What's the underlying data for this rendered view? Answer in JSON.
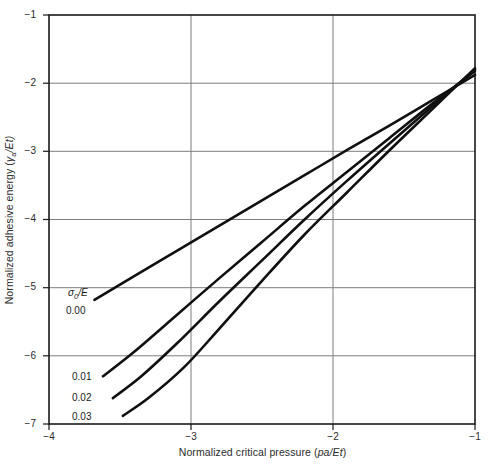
{
  "chart_data": {
    "type": "line",
    "title": "",
    "xlabel": "Normalized critical pressure (pa/Et)",
    "ylabel": "Normalized adhesive energy (γa/Et)",
    "xlim": [
      -4,
      -1
    ],
    "ylim": [
      -7,
      -1
    ],
    "xticks": [
      -4,
      -3,
      -2,
      -1
    ],
    "yticks": [
      -1,
      -2,
      -3,
      -4,
      -5,
      -6,
      -7
    ],
    "xtick_labels": [
      "−4",
      "−3",
      "−2",
      "−1"
    ],
    "ytick_labels": [
      "−1",
      "−2",
      "−3",
      "−4",
      "−5",
      "−6",
      "−7"
    ],
    "grid": true,
    "grid_color": "#808080",
    "legend_position": "inside-left",
    "series_parameter_label": "σ0/E",
    "line_color": "#101010",
    "series": [
      {
        "name": "0.00",
        "label": "0.00",
        "x": [
          -3.68,
          -3.4,
          -3.1,
          -2.8,
          -2.5,
          -2.2,
          -1.9,
          -1.6,
          -1.3,
          -1.0
        ],
        "y": [
          -5.18,
          -4.83,
          -4.46,
          -4.09,
          -3.72,
          -3.35,
          -2.98,
          -2.62,
          -2.25,
          -1.88
        ]
      },
      {
        "name": "0.01",
        "label": "0.01",
        "x": [
          -3.62,
          -3.4,
          -3.1,
          -2.8,
          -2.5,
          -2.2,
          -1.9,
          -1.6,
          -1.3,
          -1.0
        ],
        "y": [
          -6.3,
          -5.94,
          -5.4,
          -4.86,
          -4.33,
          -3.8,
          -3.3,
          -2.8,
          -2.3,
          -1.82
        ]
      },
      {
        "name": "0.02",
        "label": "0.02",
        "x": [
          -3.55,
          -3.35,
          -3.1,
          -2.8,
          -2.5,
          -2.2,
          -1.9,
          -1.6,
          -1.3,
          -1.0
        ],
        "y": [
          -6.62,
          -6.3,
          -5.82,
          -5.2,
          -4.6,
          -4.0,
          -3.43,
          -2.88,
          -2.34,
          -1.8
        ]
      },
      {
        "name": "0.03",
        "label": "0.03",
        "x": [
          -3.48,
          -3.3,
          -3.05,
          -2.8,
          -2.5,
          -2.2,
          -1.9,
          -1.6,
          -1.3,
          -1.0
        ],
        "y": [
          -6.88,
          -6.62,
          -6.17,
          -5.6,
          -4.9,
          -4.22,
          -3.6,
          -2.98,
          -2.38,
          -1.78
        ]
      }
    ]
  },
  "axes": {
    "y_title_prefix": "Normalized adhesive energy (",
    "y_title_symbol": "γ",
    "y_title_sub": "a",
    "y_title_suffix": "/Et)",
    "x_title_prefix": "Normalized critical pressure (",
    "x_title_symbol": "pa/Et",
    "x_title_suffix": ")"
  },
  "legend": {
    "parameter_symbol": "σ",
    "parameter_sub": "0",
    "parameter_denom": "/E",
    "entries": [
      "0.00",
      "0.01",
      "0.02",
      "0.03"
    ]
  }
}
